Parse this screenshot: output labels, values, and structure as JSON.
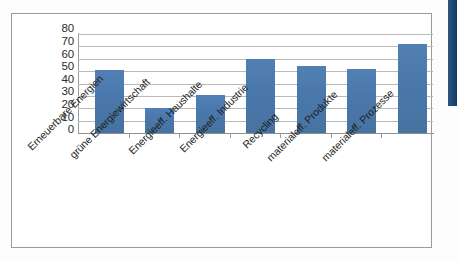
{
  "figure": {
    "frame_color": "#9a9a9a",
    "plot_background": "#ffffff",
    "edge_strip_color": "#1d4a75"
  },
  "chart_data": {
    "type": "bar",
    "title": "",
    "subtitle": "",
    "xlabel": "",
    "ylabel": "",
    "ylim": [
      0,
      80
    ],
    "ytick_step": 10,
    "ytick_labels": [
      "80",
      "70",
      "60",
      "50",
      "40",
      "30",
      "20",
      "10",
      "0"
    ],
    "ytick_values": [
      80,
      70,
      60,
      50,
      40,
      30,
      20,
      10,
      0
    ],
    "grid": true,
    "grid_axis": "y",
    "legend": false,
    "legend_position": "none",
    "series_color": "#4a78ad",
    "categories": [
      "Erneuerbare Energien",
      "grüne Energiewirtschaft",
      "Energieeff. Haushalte",
      "Energieeff. Industrie",
      "Recycling",
      "materialeff. Produkte",
      "materialeff. Prozesse"
    ],
    "values": [
      51,
      20,
      31,
      60,
      54,
      52,
      72
    ],
    "series": [
      {
        "name": "",
        "values": [
          51,
          20,
          31,
          60,
          54,
          52,
          72
        ]
      }
    ]
  }
}
